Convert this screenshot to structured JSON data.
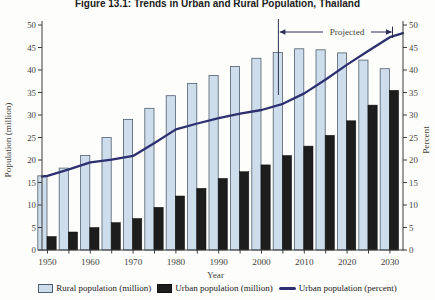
{
  "figure": {
    "title": "Figure 13.1: Trends in Urban and Rural Population, Thailand"
  },
  "chart_data": {
    "type": "bar+line",
    "title": "Figure 13.1: Trends in Urban and Rural Population, Thailand",
    "categories": [
      1950,
      1955,
      1960,
      1965,
      1970,
      1975,
      1980,
      1985,
      1990,
      1995,
      2000,
      2005,
      2010,
      2015,
      2020,
      2025,
      2030
    ],
    "series": [
      {
        "name": "Rural population (million)",
        "type": "bar",
        "axis": "left",
        "color": "#cdddec",
        "stroke": "#51606f",
        "values": [
          16.5,
          18.2,
          21.0,
          25.0,
          29.0,
          31.5,
          34.3,
          37.0,
          38.8,
          40.8,
          42.6,
          43.9,
          44.7,
          44.5,
          43.8,
          42.2,
          40.3
        ]
      },
      {
        "name": "Urban population (million)",
        "type": "bar",
        "axis": "left",
        "color": "#1d1d1d",
        "stroke": "#111111",
        "values": [
          3.0,
          4.0,
          5.0,
          6.1,
          7.0,
          9.5,
          12.0,
          13.7,
          15.9,
          17.4,
          18.9,
          21.0,
          23.1,
          25.5,
          28.7,
          32.2,
          35.5
        ]
      },
      {
        "name": "Urban population (percent)",
        "type": "line",
        "axis": "right",
        "color": "#2d3070",
        "values": [
          16.5,
          17.9,
          19.5,
          20.1,
          20.9,
          23.8,
          26.8,
          28.1,
          29.3,
          30.3,
          31.1,
          32.5,
          34.8,
          37.9,
          41.2,
          44.3,
          47.3
        ]
      }
    ],
    "xlabel": "Year",
    "ylabel_left": "Population (million)",
    "ylabel_right": "Percent",
    "ylim_left": [
      0,
      50
    ],
    "ylim_right": [
      0,
      50
    ],
    "y_ticks": [
      0,
      5,
      10,
      15,
      20,
      25,
      30,
      35,
      40,
      45,
      50
    ],
    "xtick_decade_labels": [
      "1950",
      "1960",
      "1970",
      "1980",
      "1990",
      "2000",
      "2010",
      "2020",
      "2030"
    ],
    "annotation": {
      "text": "Projected",
      "at_category": 2005,
      "color": "#2e2e55"
    },
    "grid": false,
    "legend_position": "bottom",
    "style_colors": {
      "axis": "#3c3c3c",
      "tick_text": "#44443c"
    }
  }
}
